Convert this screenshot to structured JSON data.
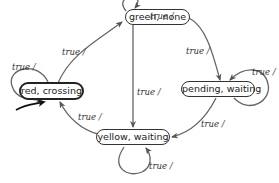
{
  "diagram": {
    "type": "state-machine",
    "states": [
      {
        "id": "green",
        "label": "green, none"
      },
      {
        "id": "red",
        "label": "red, crossing",
        "initial": true
      },
      {
        "id": "pending",
        "label": "pending, waiting"
      },
      {
        "id": "yellow",
        "label": "yellow, waiting"
      }
    ],
    "transitions": [
      {
        "from": "green",
        "to": "green",
        "label": "true /"
      },
      {
        "from": "red",
        "to": "red",
        "label": "true /"
      },
      {
        "from": "red",
        "to": "green",
        "label": "true /"
      },
      {
        "from": "green",
        "to": "pending",
        "label": "true /"
      },
      {
        "from": "pending",
        "to": "pending",
        "label": "true /"
      },
      {
        "from": "green",
        "to": "yellow",
        "label": "true /"
      },
      {
        "from": "pending",
        "to": "yellow",
        "label": "true /"
      },
      {
        "from": "yellow",
        "to": "yellow",
        "label": "true /"
      },
      {
        "from": "yellow",
        "to": "red",
        "label": "true /"
      }
    ],
    "colors": {
      "edge": "#666666",
      "node_border": "#333333",
      "text": "#222222"
    }
  }
}
